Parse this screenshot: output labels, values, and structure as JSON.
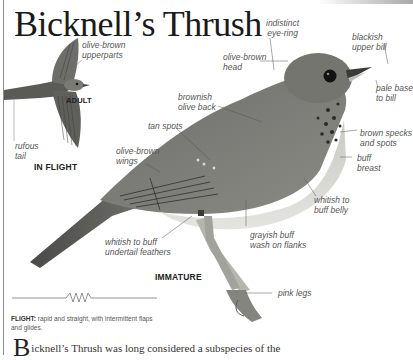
{
  "page": {
    "title": "Bicknell’s Thrush",
    "accent_color": "#a8a8a8"
  },
  "labels": {
    "olive_brown_upperparts": [
      "olive-brown",
      "upperparts"
    ],
    "rufous_tail": [
      "rufous",
      "tail"
    ],
    "indistinct_eye_ring": [
      "indistinct",
      "eye-ring"
    ],
    "blackish_upper_bill": [
      "blackish",
      "upper bill"
    ],
    "olive_brown_head": [
      "olive-brown",
      "head"
    ],
    "pale_base_to_bill": [
      "pale base",
      "to bill"
    ],
    "brownish_olive_back": [
      "brownish",
      "olive back"
    ],
    "tan_spots": [
      "tan spots"
    ],
    "brown_specks": [
      "brown specks",
      "and spots"
    ],
    "olive_brown_wings": [
      "olive-brown",
      "wings"
    ],
    "buff_breast": [
      "buff",
      "breast"
    ],
    "whitish_buff_belly": [
      "whitish to",
      "buff belly"
    ],
    "grayish_buff_flanks": [
      "grayish buff",
      "wash on flanks"
    ],
    "undertail": [
      "whitish to buff",
      "undertail feathers"
    ],
    "pink_legs": [
      "pink legs"
    ]
  },
  "captions": {
    "adult": "ADULT",
    "in_flight": "IN FLIGHT",
    "immature": "IMMATURE"
  },
  "flight": {
    "label": "FLIGHT:",
    "text": "rapid and straight, with intermittent flaps and glides."
  },
  "body": {
    "dropcap": "B",
    "text": "icknell’s Thrush was long considered a subspecies of the"
  }
}
